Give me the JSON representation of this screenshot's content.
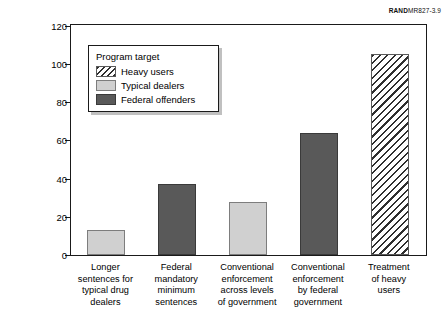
{
  "source_code": {
    "brand": "RAND",
    "rest": "MR827-3.9"
  },
  "chart_data": {
    "type": "bar",
    "title": "",
    "xlabel": "",
    "ylabel": "Kilograms of cocaine consumption reduced per million dollars spent",
    "ylabel_line1": "Kilograms of cocaine consumption reduced",
    "ylabel_line2": "per million dollars spent",
    "ylim": [
      0,
      120
    ],
    "yticks": [
      0,
      20,
      40,
      60,
      80,
      100,
      120
    ],
    "ytick_labels": [
      "0",
      "20",
      "40",
      "60",
      "80",
      "100",
      "120"
    ],
    "grid": false,
    "legend_position": "upper left",
    "legend_title": "Program target",
    "legend_entries": [
      {
        "label": "Heavy users",
        "pattern": "diagonal-hatch",
        "key": "heavy"
      },
      {
        "label": "Typical dealers",
        "color": "#d0d0d0",
        "key": "typical"
      },
      {
        "label": "Federal offenders",
        "color": "#595959",
        "key": "federal"
      }
    ],
    "categories": [
      "Longer sentences for typical drug dealers",
      "Federal mandatory minimum sentences",
      "Conventional enforcement across levels of government",
      "Conventional enforcement by federal government",
      "Treatment of heavy users"
    ],
    "category_lines": [
      [
        "Longer",
        "sentences for",
        "typical drug",
        "dealers"
      ],
      [
        "Federal",
        "mandatory",
        "minimum",
        "sentences"
      ],
      [
        "Conventional",
        "enforcement",
        "across levels",
        "of government"
      ],
      [
        "Conventional",
        "enforcement",
        "by federal",
        "government"
      ],
      [
        "Treatment",
        "of heavy",
        "users"
      ]
    ],
    "values": [
      13,
      37,
      28,
      64,
      105
    ],
    "series": [
      {
        "name": "Program target",
        "values": [
          13,
          37,
          28,
          64,
          105
        ],
        "group_keys": [
          "typical",
          "federal",
          "typical",
          "federal",
          "heavy"
        ]
      }
    ]
  }
}
